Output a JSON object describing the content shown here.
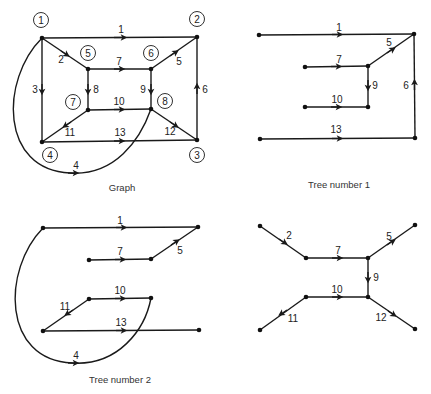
{
  "colors": {
    "ink": "#1a1a1a",
    "background": "#ffffff"
  },
  "panels": {
    "graph": {
      "caption": "Graph",
      "node_labels": [
        "1",
        "2",
        "3",
        "4",
        "5",
        "6",
        "7",
        "8"
      ],
      "edge_labels": [
        "1",
        "2",
        "3",
        "4",
        "5",
        "6",
        "7",
        "8",
        "9",
        "10",
        "11",
        "12",
        "13"
      ]
    },
    "tree1": {
      "caption": "Tree number 1",
      "edge_labels": [
        "1",
        "5",
        "7",
        "9",
        "10",
        "6",
        "13"
      ]
    },
    "tree2": {
      "caption": "Tree number 2",
      "edge_labels": [
        "1",
        "7",
        "5",
        "10",
        "11",
        "13",
        "4"
      ]
    },
    "tree3": {
      "caption": "",
      "edge_labels": [
        "2",
        "7",
        "5",
        "9",
        "10",
        "11",
        "12"
      ]
    }
  }
}
